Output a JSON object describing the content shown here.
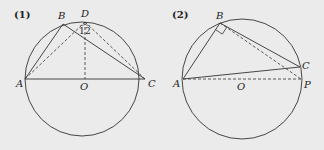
{
  "figures": [
    {
      "label": "(1)",
      "circle": {
        "cx": 82,
        "cy": 79,
        "r": 57
      },
      "points": {
        "A": {
          "x": 25,
          "y": 79,
          "label": "A"
        },
        "B": {
          "x": 63,
          "y": 24,
          "label": "B"
        },
        "C": {
          "x": 145,
          "y": 79,
          "label": "C"
        },
        "D": {
          "x": 85,
          "y": 22,
          "label": "D"
        },
        "O": {
          "x": 85,
          "y": 79,
          "label": "O"
        }
      },
      "solid_segments": [
        [
          "A",
          "B"
        ],
        [
          "B",
          "C"
        ],
        [
          "A",
          "C"
        ]
      ],
      "dashed_segments": [
        [
          "A",
          "D"
        ],
        [
          "D",
          "C"
        ],
        [
          "D",
          "O"
        ]
      ],
      "angle_labels": [
        "1",
        "2"
      ]
    },
    {
      "label": "(2)",
      "circle": {
        "cx": 242,
        "cy": 79,
        "r": 60
      },
      "points": {
        "A": {
          "x": 183,
          "y": 79,
          "label": "A"
        },
        "B": {
          "x": 220,
          "y": 23,
          "label": "B"
        },
        "C": {
          "x": 300,
          "y": 67,
          "label": "C"
        },
        "P": {
          "x": 301,
          "y": 79,
          "label": "P"
        },
        "O": {
          "x": 242,
          "y": 79,
          "label": "O"
        }
      },
      "solid_segments": [
        [
          "A",
          "B"
        ],
        [
          "B",
          "C"
        ],
        [
          "A",
          "C"
        ]
      ],
      "dashed_segments": [
        [
          "A",
          "P"
        ],
        [
          "B",
          "P"
        ]
      ],
      "right_angle_at": "B"
    }
  ]
}
